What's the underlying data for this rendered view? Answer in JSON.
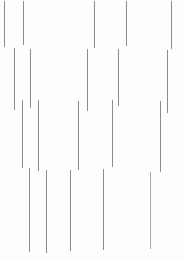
{
  "canvas": {
    "width": 185,
    "height": 260,
    "background_color": "#fdfdfd",
    "description": "Abstract pattern of thin grey vertical line segments on a white background"
  },
  "style": {
    "stroke_color": "#8c8c8c",
    "stroke_color_light": "#a8a8a8",
    "stroke_width": 1
  },
  "chart_data": {
    "type": "scatter",
    "title": "",
    "subtitle": "",
    "xlabel": "",
    "ylabel": "",
    "xlim": [
      0,
      185
    ],
    "ylim": [
      0,
      260
    ],
    "grid": false,
    "legend": null,
    "annotations": [],
    "series": [
      {
        "name": "row-1",
        "values": [
          {
            "x": 4,
            "y_top": 1,
            "y_bottom": 47,
            "color": "#8c8c8c"
          },
          {
            "x": 23,
            "y_top": 1,
            "y_bottom": 45,
            "color": "#8c8c8c"
          },
          {
            "x": 94,
            "y_top": 1,
            "y_bottom": 48,
            "color": "#8c8c8c"
          },
          {
            "x": 126,
            "y_top": 1,
            "y_bottom": 46,
            "color": "#8c8c8c"
          },
          {
            "x": 171,
            "y_top": 1,
            "y_bottom": 49,
            "color": "#8c8c8c"
          }
        ]
      },
      {
        "name": "row-2",
        "values": [
          {
            "x": 14,
            "y_top": 48,
            "y_bottom": 110,
            "color": "#8c8c8c"
          },
          {
            "x": 30,
            "y_top": 49,
            "y_bottom": 108,
            "color": "#8c8c8c"
          },
          {
            "x": 87,
            "y_top": 49,
            "y_bottom": 111,
            "color": "#8c8c8c"
          },
          {
            "x": 118,
            "y_top": 49,
            "y_bottom": 106,
            "color": "#8c8c8c"
          },
          {
            "x": 167,
            "y_top": 50,
            "y_bottom": 113,
            "color": "#8c8c8c"
          }
        ]
      },
      {
        "name": "row-3",
        "values": [
          {
            "x": 22,
            "y_top": 100,
            "y_bottom": 168,
            "color": "#8c8c8c"
          },
          {
            "x": 38,
            "y_top": 100,
            "y_bottom": 171,
            "color": "#8c8c8c"
          },
          {
            "x": 78,
            "y_top": 101,
            "y_bottom": 170,
            "color": "#8c8c8c"
          },
          {
            "x": 112,
            "y_top": 100,
            "y_bottom": 167,
            "color": "#8c8c8c"
          },
          {
            "x": 160,
            "y_top": 101,
            "y_bottom": 172,
            "color": "#8c8c8c"
          }
        ]
      },
      {
        "name": "row-4",
        "values": [
          {
            "x": 29,
            "y_top": 168,
            "y_bottom": 252,
            "color": "#8c8c8c"
          },
          {
            "x": 46,
            "y_top": 170,
            "y_bottom": 253,
            "color": "#8c8c8c"
          },
          {
            "x": 70,
            "y_top": 170,
            "y_bottom": 251,
            "color": "#8c8c8c"
          },
          {
            "x": 103,
            "y_top": 169,
            "y_bottom": 250,
            "color": "#8c8c8c"
          },
          {
            "x": 150,
            "y_top": 172,
            "y_bottom": 249,
            "color": "#a8a8a8"
          }
        ]
      }
    ]
  }
}
